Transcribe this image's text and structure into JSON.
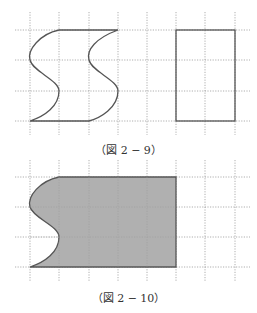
{
  "figures": [
    {
      "id": "fig-2-9",
      "caption": "（図 2 − 9）",
      "grid": {
        "x": [
          30,
          59,
          89,
          118,
          147,
          176,
          205,
          235
        ],
        "y": [
          30,
          60,
          91,
          121
        ],
        "x_extent": [
          15,
          250
        ],
        "y_extent": [
          12,
          135
        ]
      },
      "shapes": [
        {
          "name": "s-shape",
          "type": "curved-parallelogram",
          "fill": "none"
        },
        {
          "name": "rectangle",
          "type": "rect",
          "fill": "none",
          "x": [
            176,
            235
          ],
          "y": [
            30,
            121
          ]
        }
      ]
    },
    {
      "id": "fig-2-10",
      "caption": "（図 2 − 10）",
      "grid": {
        "x": [
          30,
          59,
          89,
          118,
          147,
          176,
          205,
          235
        ],
        "y": [
          177,
          207,
          237,
          267
        ],
        "x_extent": [
          15,
          250
        ],
        "y_extent": [
          160,
          282
        ]
      },
      "shapes": [
        {
          "name": "shaded-region",
          "type": "curved-left-rect",
          "fill": "#b0b0b0"
        }
      ]
    }
  ]
}
